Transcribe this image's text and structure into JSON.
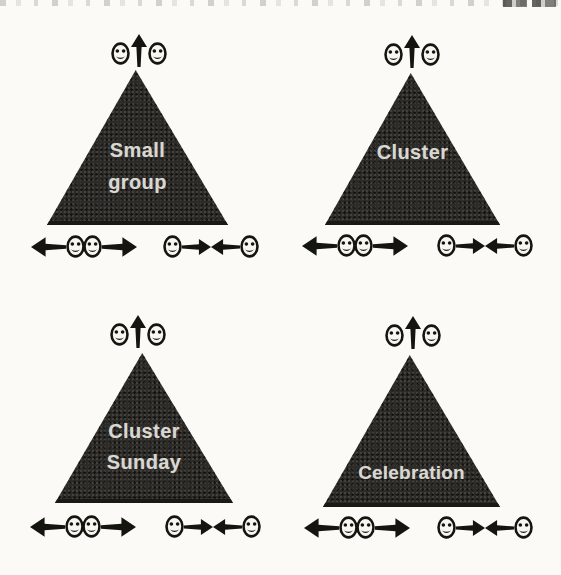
{
  "figure": {
    "type": "church-group-size-triangle-diagram",
    "panels": [
      {
        "id": "small-group",
        "label_line1": "Small",
        "label_line2": "group"
      },
      {
        "id": "cluster",
        "label_line1": "Cluster",
        "label_line2": ""
      },
      {
        "id": "cluster-sunday",
        "label_line1": "Cluster",
        "label_line2": "Sunday"
      },
      {
        "id": "celebration",
        "label_line1": "Celebration",
        "label_line2": ""
      }
    ],
    "icon_groups": {
      "top_group": [
        "smiley-face-icon",
        "up-arrow-icon",
        "smiley-face-icon"
      ],
      "bottom_left_group": [
        "left-arrow-icon",
        "smiley-face-icon",
        "smiley-face-icon",
        "right-arrow-icon"
      ],
      "bottom_right_group": [
        "smiley-face-icon",
        "right-arrow-icon",
        "left-arrow-icon",
        "smiley-face-icon"
      ]
    },
    "colors": {
      "background": "#fbfaf7",
      "triangle_fill": "#2c2b27",
      "label_text": "#d9d7d2",
      "icon_ink": "#15150f",
      "face_fill": "#f7f6f1"
    }
  }
}
